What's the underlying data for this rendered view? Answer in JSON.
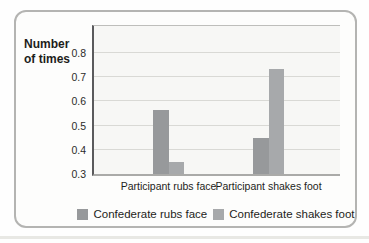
{
  "figure": {
    "border_color": "#b4b4b2",
    "plot_background": "#f7f7f5",
    "gridline_color": "#d9d9d5"
  },
  "chart_data": {
    "type": "bar",
    "title": "",
    "xlabel": "",
    "ylabel": "Number of times",
    "categories": [
      "Participant rubs face",
      "Participant shakes foot"
    ],
    "series": [
      {
        "name": "Confederate rubs face",
        "values": [
          0.565,
          0.45
        ],
        "color": "#97999b"
      },
      {
        "name": "Confederate shakes foot",
        "values": [
          0.35,
          0.735
        ],
        "color": "#a7a9ab"
      }
    ],
    "y_ticks": [
      0.3,
      0.4,
      0.5,
      0.6,
      0.7,
      0.8
    ],
    "ylim": [
      0.3,
      0.92
    ],
    "grid": true,
    "legend_position": "bottom"
  }
}
